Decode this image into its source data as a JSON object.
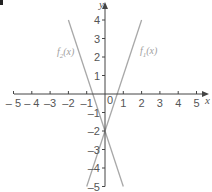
{
  "chart_data": {
    "type": "line",
    "title": "",
    "xlabel": "x",
    "ylabel": "y",
    "xlim": [
      -5,
      5
    ],
    "ylim": [
      -5,
      4
    ],
    "grid": false,
    "x_ticks": [
      -5,
      -4,
      -3,
      -2,
      -1,
      1,
      2,
      3,
      4,
      5
    ],
    "x_tick_labels": [
      "– 5",
      "– 4",
      "–3",
      "–2",
      "–1",
      "1",
      "2",
      "3",
      "4",
      "5"
    ],
    "y_ticks": [
      4,
      3,
      2,
      1,
      -1,
      -2,
      -3,
      -4,
      -5
    ],
    "y_tick_labels": [
      "4",
      "3",
      "2",
      "1",
      "–1",
      "–2",
      "–3",
      "–4",
      "–5"
    ],
    "origin_label": "0",
    "series": [
      {
        "name": "f1(x)",
        "label_main": "f",
        "label_sub": "1",
        "label_tail": "(x)",
        "expression": "3x - 2",
        "x": [
          -1,
          2
        ],
        "y": [
          -5,
          4
        ],
        "color": "#a8a8a8"
      },
      {
        "name": "f2(x)",
        "label_main": "f",
        "label_sub": "2",
        "label_tail": "(x)",
        "expression": "-3x - 2",
        "x": [
          -2,
          1
        ],
        "y": [
          4,
          -5
        ],
        "color": "#a8a8a8"
      }
    ],
    "annotations": [
      {
        "text": "f2(x)",
        "near": [
          -2.5,
          2.5
        ]
      },
      {
        "text": "f1(x)",
        "near": [
          2.6,
          2.3
        ]
      }
    ]
  },
  "colors": {
    "axis": "#444444",
    "curve": "#a8a8a8",
    "label": "#555555"
  }
}
